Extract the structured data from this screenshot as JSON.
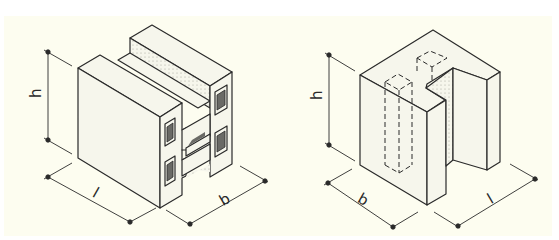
{
  "figure": {
    "background": "#fdfdf0",
    "line_color": "#2a2a2a",
    "face_fill": "#f6f6ec",
    "hatch_fill": "#6a6a66",
    "blocks": [
      {
        "id": "h-block",
        "description": "Hollow H-shaped masonry block with four vertical cores",
        "labels": {
          "height": "h",
          "length": "l",
          "width": "b"
        }
      },
      {
        "id": "u-block",
        "description": "U/L-shaped corner block with dashed hidden cores",
        "labels": {
          "height": "h",
          "width": "b",
          "length": "l"
        }
      }
    ]
  }
}
